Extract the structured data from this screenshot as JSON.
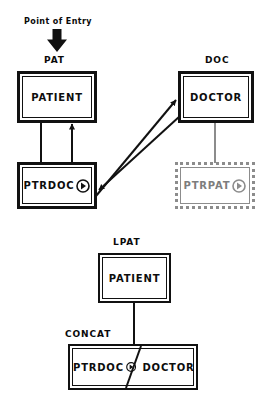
{
  "diagram": {
    "title_note": "Point of Entry",
    "colors": {
      "ink": "#111111",
      "ghost": "#8c8c8c",
      "background": "#ffffff"
    },
    "top_section": {
      "entry_label": "Point of Entry",
      "entry_arrow_icon": "down-arrow-icon",
      "pat": {
        "tag": "PAT",
        "entity": "PATIENT"
      },
      "doc": {
        "tag": "DOC",
        "entity": "DOCTOR"
      },
      "ptrdoc": {
        "entity": "PTRDOC",
        "pointer_icon": "pointer-circle-icon"
      },
      "ptrpat": {
        "entity": "PTRPAT",
        "pointer_icon": "pointer-circle-icon"
      }
    },
    "bottom_section": {
      "lpat": {
        "tag": "LPAT",
        "entity": "PATIENT"
      },
      "concat": {
        "tag": "CONCAT",
        "left_entity": "PTRDOC",
        "pointer_icon": "pointer-circle-icon",
        "right_entity": "DOCTOR"
      }
    }
  }
}
